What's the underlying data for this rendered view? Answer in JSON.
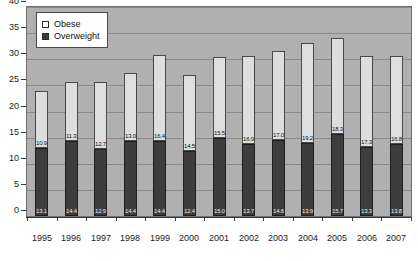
{
  "legend": {
    "position": "top-left-inside",
    "items": [
      {
        "label": "Obese",
        "swatch": "legend-swatch-obese",
        "color": "#ffffff"
      },
      {
        "label": "Overweight",
        "swatch": "legend-swatch-overweight",
        "color": "#3d3d3d"
      }
    ]
  },
  "chart_data": {
    "type": "bar",
    "subtype": "stacked-bar",
    "title": "",
    "subtitle": "",
    "xlabel": "",
    "ylabel": "",
    "ylim": [
      0,
      40
    ],
    "yticks": [
      0,
      5,
      10,
      15,
      20,
      25,
      30,
      35,
      40
    ],
    "ytick_labels": [
      "0",
      "5",
      "10",
      "15",
      "20",
      "25",
      "30",
      "35",
      "40"
    ],
    "grid": true,
    "grid_axis": "y",
    "categories": [
      "1995",
      "1996",
      "1997",
      "1998",
      "1999",
      "2000",
      "2001",
      "2002",
      "2003",
      "2004",
      "2005",
      "2006",
      "2007"
    ],
    "series": [
      {
        "name": "Overweight",
        "color": "#3d3d3d",
        "stack_order": 0,
        "values": [
          13.1,
          14.4,
          12.9,
          14.4,
          14.4,
          12.4,
          15.0,
          13.7,
          14.6,
          13.9,
          15.7,
          13.3,
          13.8
        ],
        "labels": [
          "13.1",
          "14.4",
          "12.9",
          "14.4",
          "14.4",
          "12.4",
          "15.0",
          "13.7",
          "14.6",
          "13.9",
          "15.7",
          "13.3",
          "13.8"
        ]
      },
      {
        "name": "Obese",
        "color": "#dedede",
        "stack_order": 1,
        "values": [
          10.9,
          11.3,
          12.7,
          13.0,
          16.4,
          14.5,
          15.5,
          16.9,
          17.0,
          19.2,
          18.3,
          17.3,
          16.8
        ],
        "labels": [
          "10.9",
          "11.3",
          "12.7",
          "13.0",
          "16.4",
          "14.5",
          "15.5",
          "16.9",
          "17.0",
          "19.2",
          "18.3",
          "17.3",
          "16.8"
        ]
      }
    ],
    "totals": [
      24.0,
      25.7,
      25.6,
      27.4,
      30.8,
      26.9,
      30.5,
      30.6,
      31.6,
      33.1,
      34.0,
      30.6,
      30.6
    ]
  }
}
